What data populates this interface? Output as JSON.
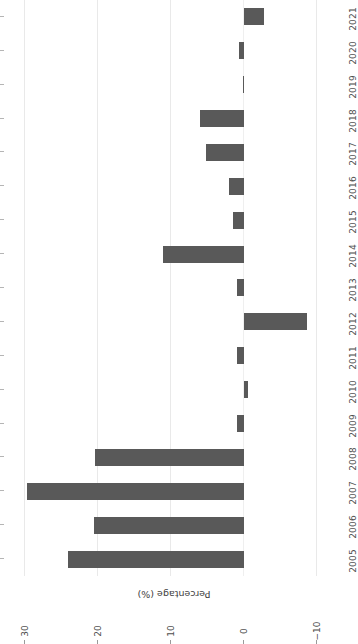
{
  "chart_data": {
    "type": "bar",
    "orientation": "horizontal-rotated-180",
    "title": "",
    "xlabel": "",
    "ylabel": "Percentage (%)",
    "categories": [
      "2005",
      "2006",
      "2007",
      "2008",
      "2009",
      "2010",
      "2011",
      "2012",
      "2013",
      "2014",
      "2015",
      "2016",
      "2017",
      "2018",
      "2019",
      "2020",
      "2021"
    ],
    "values": [
      24.1,
      20.5,
      29.7,
      20.4,
      0.9,
      -0.5,
      0.9,
      -8.6,
      1.0,
      11.1,
      1.5,
      2.0,
      5.2,
      6.0,
      0.1,
      0.7,
      -2.8
    ],
    "value_ticks": [
      30,
      20,
      10,
      0,
      -10
    ],
    "value_tick_labels": [
      "30",
      "20",
      "10",
      "0",
      "−10"
    ],
    "ylim": [
      -13,
      32
    ],
    "grid": true,
    "legend": null,
    "bar_color": "#595959",
    "grid_color": "#e9e9e9",
    "text_color": "#4d4d4d"
  },
  "axis": {
    "value_axis_title": "Percentage (%)"
  }
}
